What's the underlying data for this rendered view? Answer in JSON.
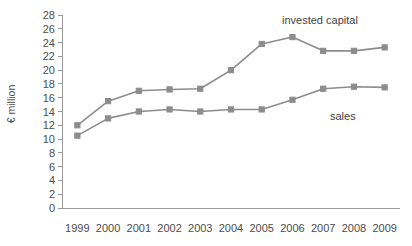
{
  "chart_data": {
    "type": "line",
    "title": "",
    "xlabel": "",
    "ylabel": "€ million",
    "categories": [
      "1999",
      "2000",
      "2001",
      "2002",
      "2003",
      "2004",
      "2005",
      "2006",
      "2007",
      "2008",
      "2009"
    ],
    "ylim": [
      0,
      28
    ],
    "ytick_step": 2,
    "yticks": [
      0,
      2,
      4,
      6,
      8,
      10,
      12,
      14,
      16,
      18,
      20,
      22,
      24,
      26,
      28
    ],
    "ytick_labels": [
      "0",
      "2",
      "4",
      "6",
      "8",
      "10",
      "12",
      "14",
      "16",
      "18",
      "20",
      "22",
      "24",
      "26",
      "28"
    ],
    "grid": false,
    "legend_position": "inline-annotation",
    "series": [
      {
        "name": "invested capital",
        "color": "#8c8c8c",
        "marker": "square",
        "values": [
          12.0,
          15.5,
          17.0,
          17.2,
          17.3,
          20.0,
          23.8,
          24.8,
          22.8,
          22.8,
          23.3
        ]
      },
      {
        "name": "sales",
        "color": "#8c8c8c",
        "marker": "square",
        "values": [
          10.5,
          13.0,
          14.0,
          14.3,
          14.0,
          14.3,
          14.3,
          15.7,
          17.3,
          17.6,
          17.5
        ]
      }
    ],
    "annotations": [
      {
        "text": "invested capital",
        "series": "invested capital"
      },
      {
        "text": "sales",
        "series": "sales"
      }
    ],
    "colors": {
      "axis": "#9a9a9a",
      "text": "#4d4d4d",
      "series": "#8c8c8c",
      "background": "#ffffff"
    }
  },
  "axes": {
    "y_title": "€ million"
  },
  "labels": {
    "invested_capital": "invested capital",
    "sales": "sales"
  }
}
